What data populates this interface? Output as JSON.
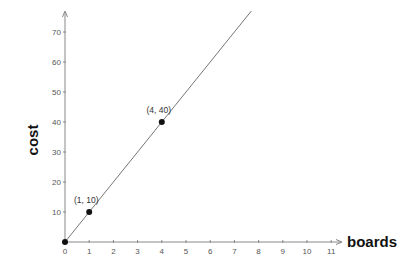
{
  "chart_data": {
    "type": "line",
    "title": "",
    "xlabel": "boards",
    "ylabel": "cost",
    "x_ticks": [
      0,
      1,
      2,
      3,
      4,
      5,
      6,
      7,
      8,
      9,
      10,
      11
    ],
    "y_ticks": [
      10,
      20,
      30,
      40,
      50,
      60,
      70
    ],
    "xlim": [
      0,
      11.5
    ],
    "ylim": [
      0,
      77
    ],
    "grid": false,
    "legend": null,
    "series": [
      {
        "name": "cost = 10 × boards",
        "slope": 10,
        "intercept": 0,
        "x": [
          0,
          7.7
        ],
        "y": [
          0,
          77
        ]
      }
    ],
    "points": [
      {
        "x": 0,
        "y": 0,
        "label": ""
      },
      {
        "x": 1,
        "y": 10,
        "label": "(1, 10)"
      },
      {
        "x": 4,
        "y": 40,
        "label": "(4, 40)"
      }
    ],
    "colors": {
      "line": "#666666",
      "axis": "#888888",
      "point": "#111111"
    }
  }
}
